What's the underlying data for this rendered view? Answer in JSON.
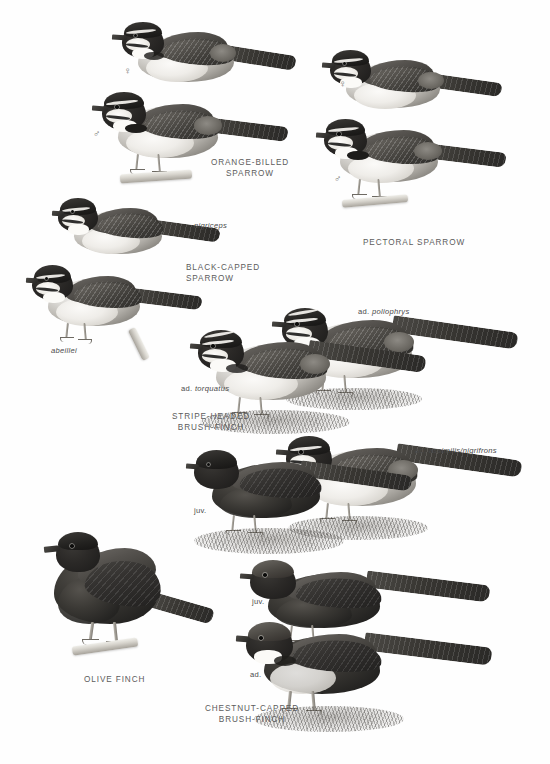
{
  "plate": {
    "type": "field-guide-plate",
    "palette": "grayscale",
    "background": "#fefefe",
    "text_color": "#5c5c5c"
  },
  "species": [
    {
      "id": "orange-billed-sparrow",
      "common_name": "ORANGE-BILLED\nSPARROW",
      "figures": [
        {
          "label": "♀",
          "kind": "sex-symbol"
        },
        {
          "label": "♂",
          "kind": "sex-symbol"
        }
      ]
    },
    {
      "id": "pectoral-sparrow",
      "common_name": "PECTORAL SPARROW",
      "figures": [
        {
          "label": "♀",
          "kind": "sex-symbol"
        },
        {
          "label": "♂",
          "kind": "sex-symbol"
        }
      ]
    },
    {
      "id": "black-capped-sparrow",
      "common_name": "BLACK-CAPPED\nSPARROW",
      "figures": [
        {
          "label": "nigriceps",
          "kind": "subspecies"
        },
        {
          "label": "abeillei",
          "kind": "subspecies"
        }
      ]
    },
    {
      "id": "stripe-headed-brush-finch",
      "common_name": "STRIPE-HEADED\nBRUSH-FINCH",
      "figures": [
        {
          "age": "ad.",
          "subspecies": "poliophrys"
        },
        {
          "age": "ad.",
          "subspecies": "torquatus"
        },
        {
          "age": "ad.",
          "subspecies": "assimilis/nigrifrons"
        },
        {
          "age": "juv.",
          "subspecies": ""
        }
      ]
    },
    {
      "id": "olive-finch",
      "common_name": "OLIVE FINCH",
      "figures": []
    },
    {
      "id": "chestnut-capped-brush-finch",
      "common_name": "CHESTNUT-CAPPED\nBRUSH-FINCH",
      "figures": [
        {
          "age": "juv.",
          "subspecies": ""
        },
        {
          "age": "ad.",
          "subspecies": ""
        }
      ]
    }
  ],
  "labels": {
    "orange_billed_sparrow": "ORANGE-BILLED\nSPARROW",
    "pectoral_sparrow": "PECTORAL SPARROW",
    "black_capped_sparrow": "BLACK-CAPPED\nSPARROW",
    "stripe_headed_brush_finch": "STRIPE-HEADED\nBRUSH-FINCH",
    "olive_finch": "OLIVE FINCH",
    "chestnut_capped_brush_finch": "CHESTNUT-CAPPED\nBRUSH-FINCH",
    "nigriceps": "nigriceps",
    "abeillei": "abeillei",
    "ad_poliophrys_age": "ad.",
    "ad_poliophrys_ssp": "poliophrys",
    "ad_torquatus_age": "ad.",
    "ad_torquatus_ssp": "torquatus",
    "ad_assimilis_age": "ad.",
    "ad_assimilis_ssp": "assimilis/nigrifrons",
    "juv_stripe_headed": "juv.",
    "juv_chestnut_capped": "juv.",
    "ad_chestnut_capped": "ad.",
    "female_symbol_obs": "♀",
    "male_symbol_obs": "♂",
    "female_symbol_ps": "♀",
    "male_symbol_ps": "♂"
  }
}
